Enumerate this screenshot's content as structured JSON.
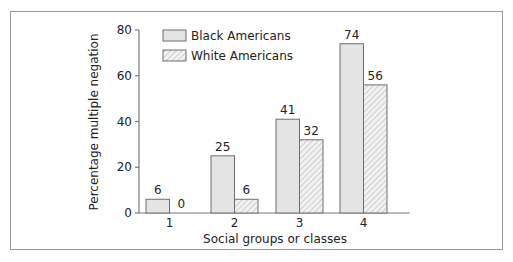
{
  "chart_data": {
    "type": "bar",
    "title": "",
    "xlabel": "Social groups or classes",
    "ylabel": "Percentage multiple negation",
    "categories": [
      "1",
      "2",
      "3",
      "4"
    ],
    "series": [
      {
        "name": "Black Americans",
        "values": [
          6,
          25,
          41,
          74
        ],
        "fill": "#e4e4e4",
        "pattern": "solid"
      },
      {
        "name": "White Americans",
        "values": [
          0,
          6,
          32,
          56
        ],
        "fill": "#f2f2f2",
        "pattern": "hatched"
      }
    ],
    "ylim": [
      0,
      80
    ],
    "yticks": [
      0,
      20,
      40,
      60,
      80
    ],
    "grid": false,
    "legend_position": "top-left inside plot",
    "data_labels": true
  },
  "colors": {
    "bar_outline": "#6e6e6e",
    "axis": "#7a7a7a",
    "frame": "#9a9a9a",
    "hatch": "#b5b5b5"
  }
}
